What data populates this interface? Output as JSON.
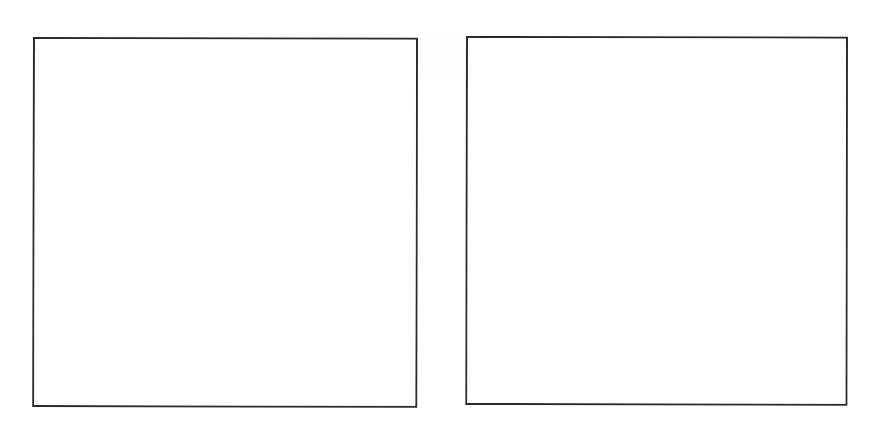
{
  "page": {
    "background_color": "#ffffff",
    "width": 889,
    "height": 421
  },
  "figures": [
    {
      "id": "figure-left",
      "position": "left",
      "caption": "",
      "content": "",
      "border_color": "#2b2b2b",
      "border_width": "2px",
      "fill_color": "#ffffff",
      "alt_text": "Empty framed box (left)"
    },
    {
      "id": "figure-right",
      "position": "right",
      "caption": "",
      "content": "",
      "border_color": "#2b2b2b",
      "border_width": "2px",
      "fill_color": "#ffffff",
      "alt_text": "Empty framed box (right)"
    }
  ]
}
